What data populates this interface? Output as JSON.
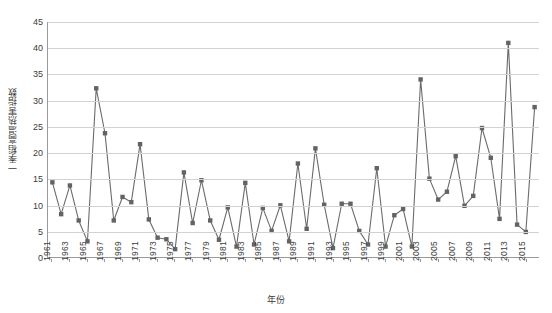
{
  "chart_data": {
    "type": "line",
    "title": "",
    "xlabel": "年份",
    "ylabel": "一季稻高温热害指数",
    "ylim": [
      0,
      45
    ],
    "ytick_step": 5,
    "yticks": [
      0,
      5,
      10,
      15,
      20,
      25,
      30,
      35,
      40,
      45
    ],
    "grid": true,
    "legend": "none",
    "marker": "square",
    "series_color": "#6b6b6b",
    "marker_color": "#636363",
    "x_tick_interval": 2,
    "xtick_labels": [
      "1961",
      "1963",
      "1965",
      "1967",
      "1969",
      "1971",
      "1973",
      "1975",
      "1977",
      "1979",
      "1981",
      "1983",
      "1985",
      "1987",
      "1989",
      "1991",
      "1993",
      "1995",
      "1997",
      "1999",
      "2001",
      "2003",
      "2005",
      "2007",
      "2009",
      "2011",
      "2013",
      "2015"
    ],
    "x": [
      1961,
      1962,
      1963,
      1964,
      1965,
      1966,
      1967,
      1968,
      1969,
      1970,
      1971,
      1972,
      1973,
      1974,
      1975,
      1976,
      1977,
      1978,
      1979,
      1980,
      1981,
      1982,
      1983,
      1984,
      1985,
      1986,
      1987,
      1988,
      1989,
      1990,
      1991,
      1992,
      1993,
      1994,
      1995,
      1996,
      1997,
      1998,
      1999,
      2000,
      2001,
      2002,
      2003,
      2004,
      2005,
      2006,
      2007,
      2008,
      2009,
      2010,
      2011,
      2012,
      2013,
      2014,
      2015,
      2016
    ],
    "values": [
      14.3,
      8.2,
      13.7,
      7.0,
      3.0,
      32.3,
      23.7,
      7.0,
      11.5,
      10.5,
      21.6,
      7.2,
      3.7,
      3.4,
      1.5,
      16.2,
      6.5,
      14.7,
      7.0,
      3.3,
      9.5,
      2.0,
      14.2,
      2.4,
      9.4,
      5.0,
      9.9,
      3.0,
      17.9,
      5.4,
      20.8,
      10.0,
      1.7,
      10.2,
      10.2,
      5.0,
      2.4,
      17.0,
      2.0,
      8.0,
      9.2,
      2.0,
      34.0,
      15.0,
      11.0,
      12.5,
      19.3,
      9.8,
      11.7,
      24.7,
      19.0,
      7.3,
      41.0,
      6.2,
      4.8,
      28.7
    ]
  }
}
